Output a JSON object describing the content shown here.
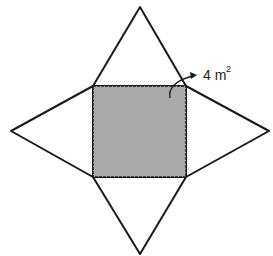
{
  "diagram": {
    "type": "pyramid-net",
    "colors": {
      "square_fill": "#a9a9a9",
      "stroke": "#1a1a1a",
      "background": "#ffffff"
    },
    "square": {
      "x1": 93,
      "y1": 86,
      "x2": 186,
      "y2": 177
    },
    "apexes": {
      "top": [
        140,
        7
      ],
      "left": [
        11,
        131
      ],
      "right": [
        269,
        131
      ],
      "bottom": [
        140,
        254
      ]
    },
    "annotation": {
      "value": "4 m",
      "exponent": "2",
      "target": "square"
    }
  }
}
